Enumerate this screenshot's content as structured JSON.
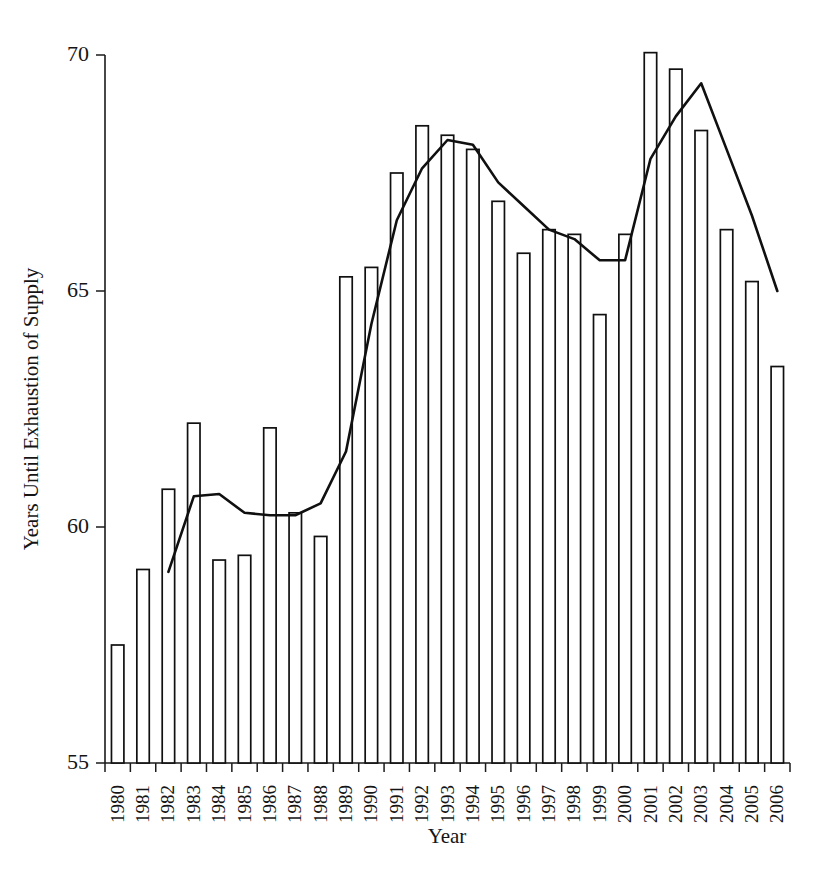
{
  "chart_data": {
    "type": "bar",
    "title": "",
    "subtitle": "",
    "xlabel": "Year",
    "ylabel": "Years Until Exhaustion of Supply",
    "grid": false,
    "legend": "none",
    "ylim": [
      55,
      70
    ],
    "ytick_values": [
      55,
      60,
      65,
      70
    ],
    "ytick_labels": [
      "55",
      "60",
      "65",
      "70"
    ],
    "categories": [
      "1980",
      "1981",
      "1982",
      "1983",
      "1984",
      "1985",
      "1986",
      "1987",
      "1988",
      "1989",
      "1990",
      "1991",
      "1992",
      "1993",
      "1994",
      "1995",
      "1996",
      "1997",
      "1998",
      "1999",
      "2000",
      "2001",
      "2002",
      "2003",
      "2004",
      "2005",
      "2006"
    ],
    "series": [
      {
        "name": "Years Until Exhaustion of Supply",
        "render": "bar",
        "values": [
          57.5,
          59.1,
          60.8,
          62.2,
          59.3,
          59.4,
          62.1,
          60.3,
          59.8,
          65.3,
          65.5,
          67.5,
          68.5,
          68.3,
          68.0,
          66.9,
          65.8,
          66.3,
          66.2,
          64.5,
          66.2,
          70.05,
          69.7,
          68.4,
          66.3,
          65.2,
          63.4
        ]
      },
      {
        "name": "Trend",
        "render": "line",
        "x": [
          "1982",
          "1983",
          "1984",
          "1985",
          "1986",
          "1987",
          "1988",
          "1989",
          "1990",
          "1991",
          "1992",
          "1993",
          "1994",
          "1995",
          "1996",
          "1997",
          "1998",
          "1999",
          "2000",
          "2001",
          "2002",
          "2003",
          "2004",
          "2005",
          "2006"
        ],
        "values": [
          59.05,
          60.65,
          60.7,
          60.3,
          60.25,
          60.25,
          60.5,
          61.6,
          64.3,
          66.5,
          67.6,
          68.2,
          68.1,
          67.3,
          66.8,
          66.3,
          66.1,
          65.65,
          65.65,
          67.8,
          68.7,
          69.4,
          68.0,
          66.6,
          65.0
        ]
      }
    ]
  },
  "axis": {
    "y_title": "Years Until Exhaustion of Supply",
    "x_title": "Year"
  }
}
